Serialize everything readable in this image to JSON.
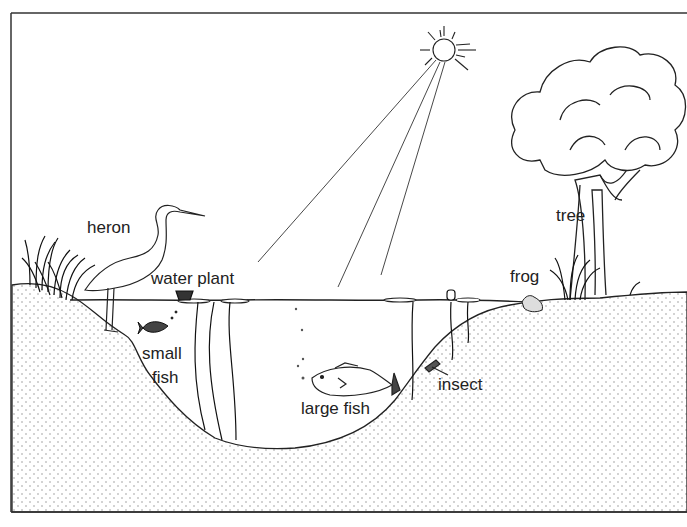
{
  "diagram": {
    "colors": {
      "line": "#222222",
      "soil_dot": "#9a9a9a",
      "background": "#ffffff"
    },
    "labels": {
      "heron": "heron",
      "water_plant": "water plant",
      "small_fish_line1": "small",
      "small_fish_line2": "fish",
      "large_fish": "large fish",
      "insect": "insect",
      "frog": "frog",
      "tree": "tree"
    },
    "elements": [
      {
        "id": "sun",
        "label": ""
      },
      {
        "id": "sunlight-rays",
        "label": ""
      },
      {
        "id": "tree",
        "label": "tree"
      },
      {
        "id": "heron",
        "label": "heron"
      },
      {
        "id": "water-plant",
        "label": "water plant"
      },
      {
        "id": "small-fish",
        "label": "small fish"
      },
      {
        "id": "large-fish",
        "label": "large fish"
      },
      {
        "id": "insect",
        "label": "insect"
      },
      {
        "id": "frog",
        "label": "frog"
      },
      {
        "id": "grass-left",
        "label": ""
      },
      {
        "id": "grass-right",
        "label": ""
      },
      {
        "id": "pond-water",
        "label": ""
      },
      {
        "id": "soil",
        "label": ""
      }
    ]
  }
}
